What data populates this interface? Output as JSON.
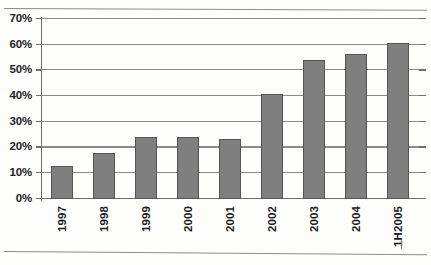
{
  "chart_data": {
    "type": "bar",
    "title": "",
    "subtitle": "",
    "xlabel": "",
    "ylabel": "",
    "categories": [
      "1997",
      "1998",
      "1999",
      "2000",
      "2001",
      "2002",
      "2003",
      "2004",
      "1H2005"
    ],
    "values": [
      13,
      18,
      24,
      24,
      23.5,
      41,
      54,
      56.5,
      60.5
    ],
    "value_labels": [
      "13%",
      "18%",
      "24%",
      "24%",
      "23.5%",
      "41%",
      "54%",
      "56.5%",
      "60.5%"
    ],
    "ylim": [
      0,
      70
    ],
    "ytick_values": [
      0,
      10,
      20,
      30,
      40,
      50,
      60,
      70
    ],
    "ytick_labels": [
      "0%",
      "10%",
      "20%",
      "30%",
      "40%",
      "50%",
      "60%",
      "70%"
    ],
    "grid": true,
    "legend": null,
    "legend_position": "none",
    "series": [
      {
        "name": "",
        "values": [
          13,
          18,
          24,
          24,
          23.5,
          41,
          54,
          56.5,
          60.5
        ],
        "color": "#7f7f7f"
      }
    ],
    "colors": {
      "bar_fill": "#7f7f7f",
      "bar_border": "#555555",
      "gridline": "#8a8a8a",
      "axis": "#6e6e6e",
      "background": "#fdfdfc",
      "text": "#1c1c1c"
    }
  }
}
